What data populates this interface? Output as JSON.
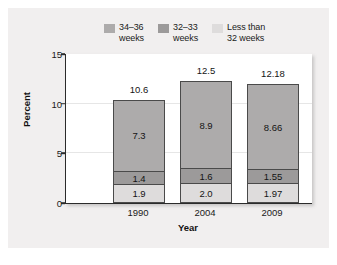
{
  "chart_data": {
    "type": "bar",
    "subtype": "stacked-bar",
    "title": "",
    "xlabel": "Year",
    "ylabel": "Percent",
    "categories": [
      "1990",
      "2004",
      "2009"
    ],
    "ylim": [
      0,
      15
    ],
    "yticks": [
      0,
      5,
      10,
      15
    ],
    "ytick_labels": [
      "0",
      "5",
      "10",
      "15"
    ],
    "grid": true,
    "grid_values": [
      5,
      10
    ],
    "legend_position": "top",
    "series": [
      {
        "name": "Less than 32 weeks",
        "legend_label": "Less than\n32 weeks",
        "color": "#dedcdc",
        "values": [
          1.9,
          2.0,
          1.97
        ],
        "value_labels": [
          "1.9",
          "2.0",
          "1.97"
        ]
      },
      {
        "name": "32-33 weeks",
        "legend_label": "32–33\nweeks",
        "color": "#9c9a9a",
        "values": [
          1.4,
          1.6,
          1.55
        ],
        "value_labels": [
          "1.4",
          "1.6",
          "1.55"
        ]
      },
      {
        "name": "34-36 weeks",
        "legend_label": "34–36\nweeks",
        "color": "#adabab",
        "values": [
          7.3,
          8.9,
          8.66
        ],
        "value_labels": [
          "7.3",
          "8.9",
          "8.66"
        ]
      }
    ],
    "totals": [
      10.6,
      12.5,
      12.18
    ],
    "total_labels": [
      "10.6",
      "12.5",
      "12.18"
    ]
  },
  "legend": {
    "entries": [
      {
        "label": "34–36\nweeks",
        "color": "#adabab"
      },
      {
        "label": "32–33\nweeks",
        "color": "#9c9a9a"
      },
      {
        "label": "Less than\n32 weeks",
        "color": "#dedcdc"
      }
    ]
  },
  "axes": {
    "y_title": "Percent",
    "x_title": "Year",
    "y_ticks": [
      "15",
      "10",
      "5",
      "0"
    ],
    "x_ticks": [
      "1990",
      "2004",
      "2009"
    ]
  },
  "bars": [
    {
      "category": "1990",
      "total_label": "10.6",
      "segments": [
        {
          "series": "34-36 weeks",
          "label": "7.3"
        },
        {
          "series": "32-33 weeks",
          "label": "1.4"
        },
        {
          "series": "Less than 32 weeks",
          "label": "1.9"
        }
      ]
    },
    {
      "category": "2004",
      "total_label": "12.5",
      "segments": [
        {
          "series": "34-36 weeks",
          "label": "8.9"
        },
        {
          "series": "32-33 weeks",
          "label": "1.6"
        },
        {
          "series": "Less than 32 weeks",
          "label": "2.0"
        }
      ]
    },
    {
      "category": "2009",
      "total_label": "12.18",
      "segments": [
        {
          "series": "34-36 weeks",
          "label": "8.66"
        },
        {
          "series": "32-33 weeks",
          "label": "1.55"
        },
        {
          "series": "Less than 32 weeks",
          "label": "1.97"
        }
      ]
    }
  ],
  "colors": {
    "panel_background": "#f1efef",
    "plot_background": "#ffffff",
    "axis": "#2b2b2b",
    "gridline": "#e6e6e6",
    "segment_border": "#4a4a4a"
  }
}
